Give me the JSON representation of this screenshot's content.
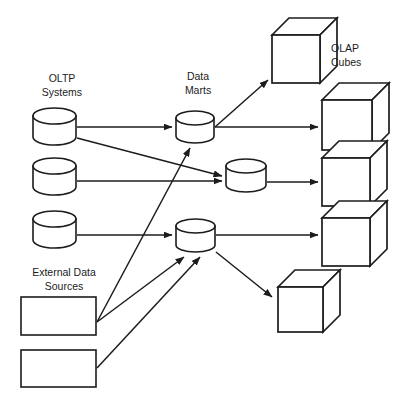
{
  "diagram": {
    "background_color": "#ffffff",
    "stroke_color": "#1c1c1c",
    "labels": {
      "oltp": {
        "line1": "OLTP",
        "line2": "Systems",
        "x": 62,
        "y": 82
      },
      "data_marts": {
        "line1": "Data",
        "line2": "Marts",
        "x": 198,
        "y": 80
      },
      "olap": {
        "line1": "OLAP",
        "line2": "Cubes",
        "x": 331,
        "y": 52
      },
      "external": {
        "line1": "External Data",
        "line2": "Sources",
        "x": 64,
        "y": 276
      }
    },
    "oltp_systems": [
      {
        "name": "oltp-cylinder-1",
        "x": 33,
        "y": 108,
        "w": 43,
        "h": 37
      },
      {
        "name": "oltp-cylinder-2",
        "x": 33,
        "y": 158,
        "w": 43,
        "h": 37
      },
      {
        "name": "oltp-cylinder-3",
        "x": 33,
        "y": 211,
        "w": 43,
        "h": 37
      }
    ],
    "external_sources": [
      {
        "name": "external-source-box-1",
        "x": 21,
        "y": 297,
        "w": 75,
        "h": 38
      },
      {
        "name": "external-source-box-2",
        "x": 21,
        "y": 350,
        "w": 75,
        "h": 37
      }
    ],
    "data_marts": [
      {
        "name": "data-mart-cylinder-1",
        "x": 176,
        "y": 110,
        "w": 38,
        "h": 33
      },
      {
        "name": "data-mart-cylinder-2",
        "x": 226,
        "y": 158,
        "w": 40,
        "h": 34
      },
      {
        "name": "data-mart-cylinder-3",
        "x": 176,
        "y": 218,
        "w": 39,
        "h": 34
      }
    ],
    "olap_cubes": [
      {
        "name": "olap-cube-1",
        "x": 272,
        "y": 35,
        "size": 48,
        "depth": 17
      },
      {
        "name": "olap-cube-2",
        "x": 322,
        "y": 100,
        "size": 50,
        "depth": 17
      },
      {
        "name": "olap-cube-3",
        "x": 322,
        "y": 158,
        "size": 48,
        "depth": 17
      },
      {
        "name": "olap-cube-4",
        "x": 322,
        "y": 218,
        "size": 48,
        "depth": 17
      },
      {
        "name": "olap-cube-5",
        "x": 278,
        "y": 287,
        "size": 45,
        "depth": 17
      }
    ],
    "connectors": [
      {
        "name": "arrow-oltp1-to-mart1",
        "from": "oltp-cylinder-1",
        "to": "data-mart-cylinder-1",
        "x1": 77,
        "y1": 127,
        "x2": 172,
        "y2": 127
      },
      {
        "name": "arrow-oltp1-to-mart2",
        "from": "oltp-cylinder-1",
        "to": "data-mart-cylinder-2",
        "x1": 77,
        "y1": 138,
        "x2": 222,
        "y2": 176
      },
      {
        "name": "arrow-oltp2-to-mart2",
        "from": "oltp-cylinder-2",
        "to": "data-mart-cylinder-2",
        "x1": 77,
        "y1": 181,
        "x2": 222,
        "y2": 181
      },
      {
        "name": "arrow-oltp3-to-mart3",
        "from": "oltp-cylinder-3",
        "to": "data-mart-cylinder-3",
        "x1": 77,
        "y1": 235,
        "x2": 172,
        "y2": 235
      },
      {
        "name": "arrow-external1-to-mart1",
        "from": "external-source-box-1",
        "to": "data-mart-cylinder-1",
        "x1": 97,
        "y1": 322,
        "x2": 190,
        "y2": 148
      },
      {
        "name": "arrow-external1-to-mart3",
        "from": "external-source-box-1",
        "to": "data-mart-cylinder-3",
        "x1": 97,
        "y1": 322,
        "x2": 184,
        "y2": 257
      },
      {
        "name": "arrow-external2-to-mart3",
        "from": "external-source-box-2",
        "to": "data-mart-cylinder-3",
        "x1": 97,
        "y1": 368,
        "x2": 200,
        "y2": 257
      },
      {
        "name": "arrow-mart1-to-cube1",
        "from": "data-mart-cylinder-1",
        "to": "olap-cube-1",
        "x1": 215,
        "y1": 127,
        "x2": 268,
        "y2": 80
      },
      {
        "name": "arrow-mart1-to-cube2",
        "from": "data-mart-cylinder-1",
        "to": "olap-cube-2",
        "x1": 215,
        "y1": 127,
        "x2": 318,
        "y2": 127
      },
      {
        "name": "arrow-mart2-to-cube3",
        "from": "data-mart-cylinder-2",
        "to": "olap-cube-3",
        "x1": 267,
        "y1": 182,
        "x2": 318,
        "y2": 182
      },
      {
        "name": "arrow-mart3-to-cube4",
        "from": "data-mart-cylinder-3",
        "to": "olap-cube-4",
        "x1": 216,
        "y1": 235,
        "x2": 318,
        "y2": 235
      },
      {
        "name": "arrow-mart3-to-cube5",
        "from": "data-mart-cylinder-3",
        "to": "olap-cube-5",
        "x1": 216,
        "y1": 252,
        "x2": 272,
        "y2": 297
      }
    ]
  }
}
